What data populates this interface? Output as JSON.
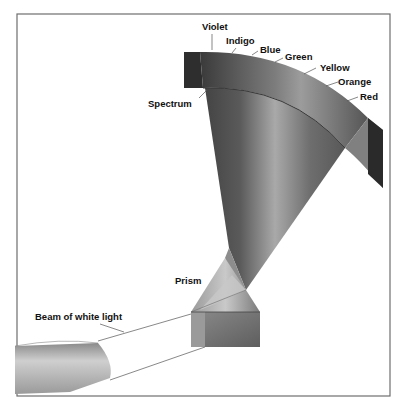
{
  "diagram": {
    "labels": {
      "violet": "Violet",
      "indigo": "Indigo",
      "blue": "Blue",
      "green": "Green",
      "yellow": "Yellow",
      "orange": "Orange",
      "red": "Red",
      "spectrum": "Spectrum",
      "prism": "Prism",
      "beam": "Beam of white light"
    },
    "spectrum_colors_order": [
      "Violet",
      "Indigo",
      "Blue",
      "Green",
      "Yellow",
      "Orange",
      "Red"
    ],
    "colors": {
      "frame": "#6e6e6e",
      "background": "#ffffff",
      "label": "#111111",
      "leader": "#555555",
      "beam_dark": "#6a6a6a",
      "beam_light": "#c4c4c4",
      "screen_dark": "#2a2a2a"
    }
  }
}
